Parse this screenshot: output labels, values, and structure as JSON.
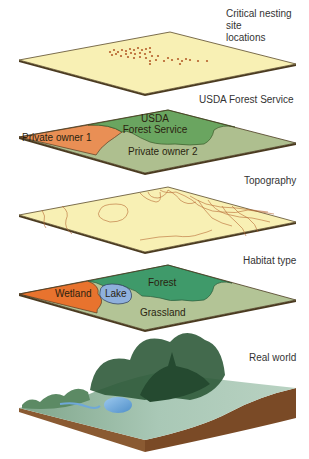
{
  "layers": [
    {
      "id": "nesting",
      "caption_lines": [
        "Critical nesting site",
        "locations"
      ],
      "fill": "#f8f0b4"
    },
    {
      "id": "ownership",
      "caption_lines": [
        "USDA Forest Service"
      ],
      "regions": [
        {
          "label": "Private owner 1",
          "color": "#e98f55"
        },
        {
          "label_lines": [
            "USDA",
            "Forest Service"
          ],
          "color": "#6aa560"
        },
        {
          "label": "Private owner 2",
          "color": "#aebf8f"
        }
      ]
    },
    {
      "id": "topography",
      "caption_lines": [
        "Topography"
      ],
      "fill": "#f8f0b4",
      "contour_color": "#b76a34"
    },
    {
      "id": "habitat",
      "caption_lines": [
        "Habitat type"
      ],
      "regions": [
        {
          "label": "Wetland",
          "color": "#e8732e"
        },
        {
          "label": "Lake",
          "color": "#8fb0dc"
        },
        {
          "label": "Forest",
          "color": "#3f9a6a"
        },
        {
          "label": "Grassland",
          "color": "#b3c496"
        }
      ]
    },
    {
      "id": "real-world",
      "caption_lines": [
        "Real world"
      ],
      "soil_color": "#8a5a32",
      "ground_color": "#a9c6b4",
      "tree_color": "#2f5a3a",
      "water_color": "#6fa8d8"
    }
  ]
}
